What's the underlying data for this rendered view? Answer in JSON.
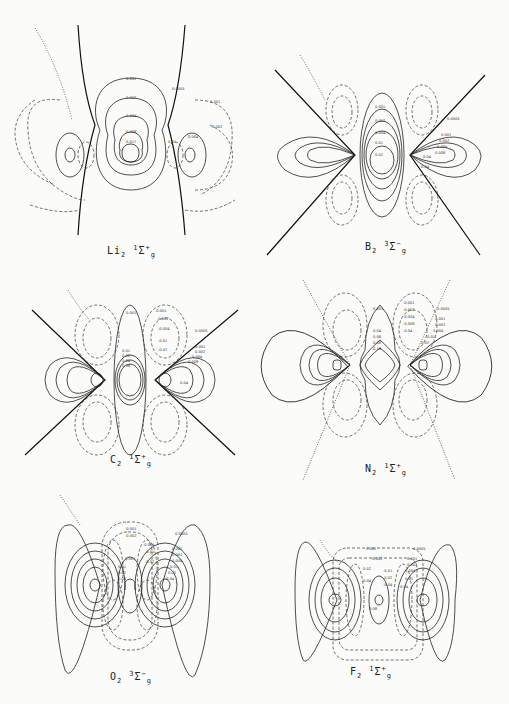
{
  "figure": {
    "panels": [
      {
        "id": "li2",
        "molecule": "Li",
        "subscript": "2",
        "term": "Σ",
        "mult": "1",
        "sup": "+",
        "sub": "g",
        "caption": "Li2 1Σg+",
        "labels": [
          "0.001",
          "0.002",
          "0.004",
          "0.008",
          "0.017",
          "0.0005",
          "0.001",
          "0.002",
          "0.004",
          "0.01"
        ]
      },
      {
        "id": "b2",
        "molecule": "B",
        "subscript": "2",
        "term": "Σ",
        "mult": "3",
        "sup": "−",
        "sub": "g",
        "caption": "B2 3Σg−",
        "labels": [
          "0.001",
          "0.002",
          "0.004",
          "0.01",
          "0.02",
          "0.04",
          "0.0005",
          "0.001",
          "0.002",
          "0.004",
          "0.008",
          "0.04"
        ]
      },
      {
        "id": "c2",
        "molecule": "C",
        "subscript": "2",
        "term": "Σ",
        "mult": "1",
        "sup": "+",
        "sub": "g",
        "caption": "C2 1Σg+",
        "labels": [
          "0.001",
          "0.01",
          "0.02",
          "0.04",
          "0.08",
          "-0.001",
          "-0.002",
          "-0.004",
          "-0.01",
          "-0.02",
          "0.0005",
          "0.001",
          "0.002",
          "0.004",
          "0.008",
          "0.04"
        ]
      },
      {
        "id": "n2",
        "molecule": "N",
        "subscript": "2",
        "term": "Σ",
        "mult": "1",
        "sup": "+",
        "sub": "g",
        "caption": "N2 1Σg+",
        "labels": [
          "0.001",
          "0.04",
          "0.06",
          "0.08",
          "0.16",
          "-0.001",
          "-0.002",
          "-0.004",
          "-0.008",
          "-0.04",
          "0.0005",
          "0.001",
          "0.002",
          "0.004",
          "0.01",
          "0.02"
        ]
      },
      {
        "id": "o2",
        "molecule": "O",
        "subscript": "2",
        "term": "Σ",
        "mult": "3",
        "sup": "−",
        "sub": "g",
        "caption": "O2 3Σg−",
        "labels": [
          "-0.001",
          "-0.002",
          "-0.004",
          "-0.01",
          "-0.02",
          "0.001",
          "0.01",
          "0.02",
          "0.04",
          "0.0005",
          "0.001",
          "0.002",
          "0.004",
          "0.01",
          "0.02",
          "0.04"
        ]
      },
      {
        "id": "f2",
        "molecule": "F",
        "subscript": "2",
        "term": "Σ",
        "mult": "1",
        "sup": "+",
        "sub": "g",
        "caption": "F2 1Σg+",
        "labels": [
          "-0.001",
          "-0.002",
          "0.02",
          "0.04",
          "0.08",
          "-0.01",
          "-0.02",
          "-0.04",
          "0.0005",
          "0.001",
          "0.002",
          "0.004",
          "0.01",
          "0.04"
        ]
      }
    ],
    "line_styles": {
      "positive": "solid",
      "negative": "dashed",
      "zero_boundary": "dotted"
    },
    "colors": {
      "ink": "#222222",
      "paper": "#fbfbf9"
    }
  }
}
